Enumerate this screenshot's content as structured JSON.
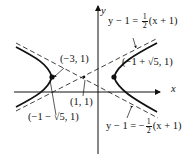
{
  "figure": {
    "type": "hyperbola-with-asymptotes",
    "axes": {
      "x_label": "x",
      "y_label": "y"
    },
    "center": {
      "label": "(1, 1)"
    },
    "vertices": [
      {
        "label": "(−3, 1)"
      },
      {
        "label": "(−1 − √5, 1)"
      },
      {
        "label": "(−1 + √5, 1)"
      }
    ],
    "asymptotes": [
      {
        "lhs": "y − 1 = ",
        "sign": "",
        "num": "1",
        "den": "2",
        "rhs": "(x + 1)"
      },
      {
        "lhs": "y − 1 = −",
        "sign": "−",
        "num": "1",
        "den": "2",
        "rhs": "(x + 1)"
      }
    ]
  }
}
